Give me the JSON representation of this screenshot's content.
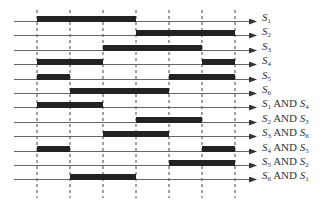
{
  "diagram": {
    "type": "timing-diagram",
    "columns": 6,
    "grid_x": [
      37,
      70,
      103,
      136,
      169,
      202,
      235
    ],
    "line_start_x": 14,
    "arrow_end_x": 256,
    "row_y_start": 21,
    "row_spacing": 14.4,
    "bar_height": 6,
    "grid_top": 10,
    "grid_bottom": 198,
    "colors": {
      "bar": "#222222",
      "baseline": "#666666",
      "grid": "#444444",
      "arrow": "#333333"
    },
    "rows": [
      {
        "label": "S1",
        "text": {
          "s1": "S",
          "n1": "1"
        },
        "segments": [
          [
            0,
            3
          ]
        ]
      },
      {
        "label": "S2",
        "text": {
          "s1": "S",
          "n1": "2"
        },
        "segments": [
          [
            3,
            6
          ]
        ]
      },
      {
        "label": "S3",
        "text": {
          "s1": "S",
          "n1": "3"
        },
        "segments": [
          [
            2,
            5
          ]
        ]
      },
      {
        "label": "S4",
        "text": {
          "s1": "S",
          "n1": "4"
        },
        "segments": [
          [
            0,
            2
          ],
          [
            5,
            6
          ]
        ]
      },
      {
        "label": "S5",
        "text": {
          "s1": "S",
          "n1": "5"
        },
        "segments": [
          [
            0,
            1
          ],
          [
            4,
            6
          ]
        ]
      },
      {
        "label": "S6",
        "text": {
          "s1": "S",
          "n1": "6"
        },
        "segments": [
          [
            1,
            4
          ]
        ]
      },
      {
        "label": "S1 AND S4",
        "text": {
          "s1": "S",
          "n1": "1",
          "op": "AND",
          "s2": "S",
          "n2": "4"
        },
        "segments": [
          [
            0,
            2
          ]
        ]
      },
      {
        "label": "S2 AND S3",
        "text": {
          "s1": "S",
          "n1": "2",
          "op": "AND",
          "s2": "S",
          "n2": "3"
        },
        "segments": [
          [
            3,
            5
          ]
        ]
      },
      {
        "label": "S3 AND S6",
        "text": {
          "s1": "S",
          "n1": "3",
          "op": "AND",
          "s2": "S",
          "n2": "6"
        },
        "segments": [
          [
            2,
            4
          ]
        ]
      },
      {
        "label": "S4 AND S5",
        "text": {
          "s1": "S",
          "n1": "4",
          "op": "AND",
          "s2": "S",
          "n2": "5"
        },
        "segments": [
          [
            0,
            1
          ],
          [
            5,
            6
          ]
        ]
      },
      {
        "label": "S5 AND S2",
        "text": {
          "s1": "S",
          "n1": "5",
          "op": "AND",
          "s2": "S",
          "n2": "2"
        },
        "segments": [
          [
            4,
            6
          ]
        ]
      },
      {
        "label": "S6 AND S1",
        "text": {
          "s1": "S",
          "n1": "6",
          "op": "AND",
          "s2": "S",
          "n2": "1"
        },
        "segments": [
          [
            1,
            3
          ]
        ]
      }
    ]
  }
}
